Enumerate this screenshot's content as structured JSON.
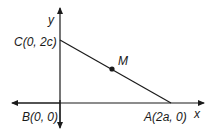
{
  "diagram": {
    "axes": {
      "x_label": "x",
      "y_label": "y"
    },
    "points": [
      {
        "name": "C",
        "label": "C(0, 2c)"
      },
      {
        "name": "M",
        "label": "M"
      },
      {
        "name": "B",
        "label": "B(0, 0)"
      },
      {
        "name": "A",
        "label": "A(2a, 0)"
      }
    ],
    "segments": [
      {
        "from": "C",
        "to": "A"
      }
    ],
    "colors": {
      "line": "#1a1a1a",
      "background": "#ffffff"
    }
  }
}
